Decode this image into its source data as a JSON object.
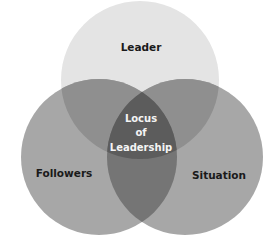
{
  "diagram": {
    "type": "venn",
    "sets": [
      {
        "id": "leader",
        "label": "Leader",
        "color": "#e4e4e4"
      },
      {
        "id": "followers",
        "label": "Followers",
        "color": "#a7a7a7"
      },
      {
        "id": "situation",
        "label": "Situation",
        "color": "#a7a7a7"
      }
    ],
    "intersections": {
      "leader_followers": "#8f8f8f",
      "leader_situation": "#8f8f8f",
      "followers_situation": "#747474",
      "all": "#5b5b5b"
    },
    "center_label": {
      "line1": "Locus",
      "line2": "of",
      "line3": "Leadership"
    },
    "label_color": "#1a1a1a",
    "center_label_color": "#f4f4f4"
  }
}
